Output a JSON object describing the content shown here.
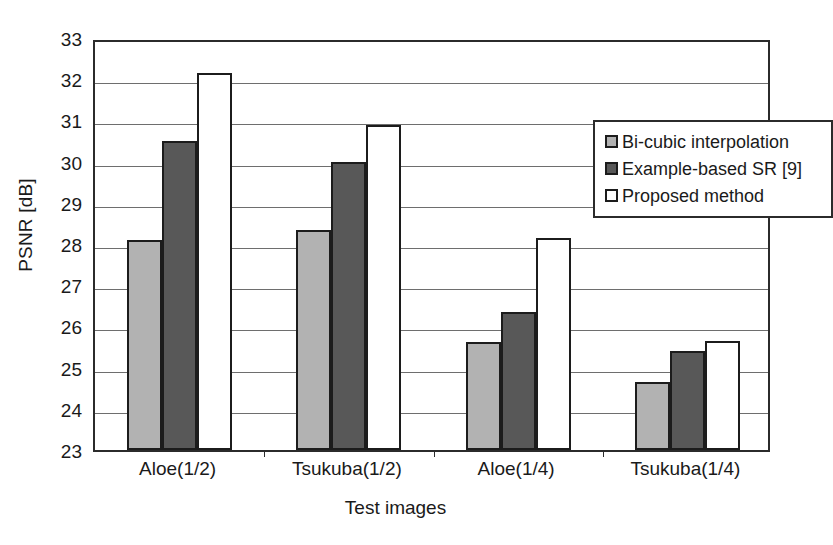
{
  "chart_data": {
    "type": "bar",
    "title": "",
    "xlabel": "Test images",
    "ylabel": "PSNR [dB]",
    "ylim": [
      23,
      33
    ],
    "ytick_step": 1,
    "yticks": [
      "33",
      "32",
      "31",
      "30",
      "29",
      "28",
      "27",
      "26",
      "25",
      "24",
      "23"
    ],
    "grid": true,
    "legend_position": "upper right",
    "categories": [
      "Aloe(1/2)",
      "Tsukuba(1/2)",
      "Aloe(1/4)",
      "Tsukuba(1/4)"
    ],
    "series": [
      {
        "name": "Bi-cubic interpolation",
        "color": "#b2b2b2",
        "values": [
          28.1,
          28.35,
          25.62,
          24.65
        ]
      },
      {
        "name": "Example-based SR [9]",
        "color": "#585858",
        "values": [
          30.5,
          30.0,
          26.35,
          25.4
        ]
      },
      {
        "name": "Proposed method",
        "color": "#ffffff",
        "values": [
          32.15,
          30.9,
          28.15,
          25.65
        ]
      }
    ]
  },
  "legend": {
    "items": [
      {
        "label": "Bi-cubic interpolation",
        "swatch": "light-gray-swatch"
      },
      {
        "label": "Example-based SR [9]",
        "swatch": "dark-gray-swatch"
      },
      {
        "label": "Proposed method",
        "swatch": "white-swatch"
      }
    ]
  }
}
